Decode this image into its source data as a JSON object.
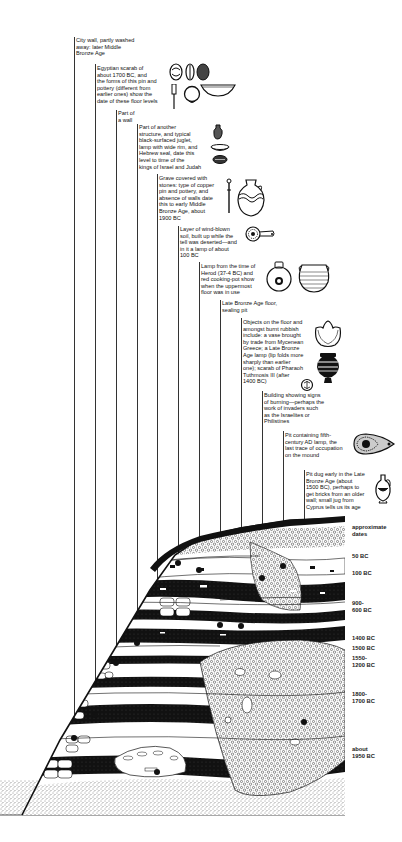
{
  "diagram": {
    "type": "archaeological-section"
  },
  "annotations": [
    {
      "id": "city-wall",
      "text": "City wall, partly washed\naway: later Middle\nBronze Age"
    },
    {
      "id": "egyptian-scarab",
      "text": "Egyptian scarab of\nabout 1700 BC, and\nthe forms of this pin and\npottery (different from\nearlier ones) show the\ndate of these floor levels"
    },
    {
      "id": "part-of-wall",
      "text": "Part of\na wall"
    },
    {
      "id": "another-structure",
      "text": "Part of another\nstructure, and typical\nblack-surfaced juglet,\nlamp with wide rim, and\nHebrew seal, date this\nlevel to time of the\nkings of Israel and Judah"
    },
    {
      "id": "grave",
      "text": "Grave covered with\nstones: type of copper\npin and pottery, and\nabsence of walls date\nthis to early Middle\nBronze Age, about\n1900 BC"
    },
    {
      "id": "wind-blown-soil",
      "text": "Layer of wind-blown\nsoil, built up while the\ntell was deserted—and\nin it a lamp of about\n100 BC"
    },
    {
      "id": "herod-lamp",
      "text": "Lamp from the time of\nHerod (37-4 BC) and\nred cooking-pot show\nwhen the uppermost\nfloor was in use"
    },
    {
      "id": "late-bronze-floor",
      "text": "Late Bronze Age floor,\nsealing pit"
    },
    {
      "id": "objects-floor",
      "text": "Objects on the floor and\namongst burnt rubbish\ninclude: a vase brought\nby trade from Mycenean\nGreece; a Late Bronze\nAge lamp (lip folds more\nsharply than earlier\none); scarab of Pharaoh\nTuthmosis III (after\n1400 BC)"
    },
    {
      "id": "burning-building",
      "text": "Building showing signs\nof burning—perhaps the\nwork of invaders such\nas the Israelites or\nPhilistines"
    },
    {
      "id": "fifth-century-pit",
      "text": "Pit containing fifth-\ncentury AD lamp, the\nlast trace of occupation\non the mound"
    },
    {
      "id": "late-bronze-pit",
      "text": "Pit dug early in the Late\nBronze Age (about\n1500 BC), perhaps to\nget bricks from an older\nwall; small jug from\nCyprus tells us its age"
    }
  ],
  "dates": {
    "header": "approximate\ndates",
    "labels": [
      "50 BC",
      "100 BC",
      "900-\n600 BC",
      "1400 BC",
      "1500 BC",
      "1550-\n1200 BC",
      "1800-\n1700 BC",
      "about\n1950 BC"
    ]
  },
  "artifacts": [
    "scarab-icon",
    "pin-icon",
    "bowl-icon",
    "seal-icon",
    "juglet-icon",
    "lamp-icon",
    "vase-icon",
    "cooking-pot-icon",
    "mycenean-vase-icon",
    "cypriot-jug-icon"
  ],
  "colors": {
    "ink": "#111111",
    "paper": "#ffffff",
    "leader": "#333333"
  }
}
